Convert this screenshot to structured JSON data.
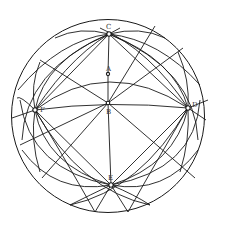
{
  "figure": {
    "type": "sphere-great-circles",
    "stroke_color": "#1a1a1a",
    "background": "#ffffff"
  },
  "labels": {
    "C": "C",
    "A": "A",
    "B": "B",
    "F": "F",
    "D": "D",
    "E": "E"
  },
  "points": {
    "C": [
      109,
      34
    ],
    "A": [
      108,
      74
    ],
    "B": [
      108,
      103
    ],
    "F": [
      35,
      110
    ],
    "D": [
      188,
      108
    ],
    "E": [
      111,
      185
    ]
  }
}
